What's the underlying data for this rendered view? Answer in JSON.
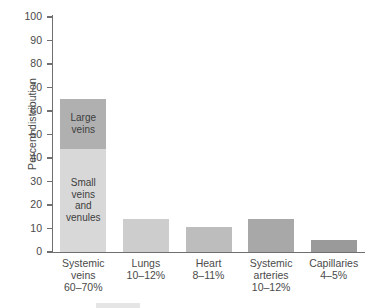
{
  "chart_data": {
    "type": "bar",
    "title": "",
    "xlabel": "",
    "ylabel": "Percent distribution",
    "ylim": [
      0,
      100
    ],
    "yticks": [
      0,
      10,
      20,
      30,
      40,
      50,
      60,
      70,
      80,
      90,
      100
    ],
    "grid": false,
    "legend": "none",
    "stacked": true,
    "categories": [
      "Systemic veins",
      "Lungs",
      "Heart",
      "Systemic arteries",
      "Capillaries"
    ],
    "category_ranges": [
      "60–70%",
      "10–12%",
      "8–11%",
      "10–12%",
      "4–5%"
    ],
    "bars": [
      {
        "category": "Systemic veins",
        "range_label": "60–70%",
        "total": 65,
        "segments": [
          {
            "label": "Small veins and venules",
            "label_lines": [
              "Small",
              "veins",
              "and",
              "venules"
            ],
            "value": 44,
            "base": 0,
            "color": "#d8d8d8"
          },
          {
            "label": "Large veins",
            "label_lines": [
              "Large",
              "veins"
            ],
            "value": 21,
            "base": 44,
            "color": "#b0b0b0"
          }
        ]
      },
      {
        "category": "Lungs",
        "range_label": "10–12%",
        "total": 14,
        "segments": [
          {
            "label": "",
            "label_lines": [],
            "value": 14,
            "base": 0,
            "color": "#cdcdcd"
          }
        ]
      },
      {
        "category": "Heart",
        "range_label": "8–11%",
        "total": 10.5,
        "segments": [
          {
            "label": "",
            "label_lines": [],
            "value": 10.5,
            "base": 0,
            "color": "#bdbdbd"
          }
        ]
      },
      {
        "category": "Systemic arteries",
        "range_label": "10–12%",
        "total": 14,
        "segments": [
          {
            "label": "",
            "label_lines": [],
            "value": 14,
            "base": 0,
            "color": "#a8a8a8"
          }
        ]
      },
      {
        "category": "Capillaries",
        "range_label": "4–5%",
        "total": 5,
        "segments": [
          {
            "label": "",
            "label_lines": [],
            "value": 5,
            "base": 0,
            "color": "#9a9a9a"
          }
        ]
      }
    ],
    "category_label_lines": [
      [
        "Systemic",
        "veins",
        "60–70%"
      ],
      [
        "Lungs",
        "10–12%"
      ],
      [
        "Heart",
        "8–11%"
      ],
      [
        "Systemic",
        "arteries",
        "10–12%"
      ],
      [
        "Capillaries",
        "4–5%"
      ]
    ],
    "colors": {
      "axis": "#6f6f6f",
      "text": "#4a4a4a",
      "bar_light": "#d8d8d8",
      "bar_mid": "#bdbdbd",
      "bar_dark": "#a8a8a8",
      "background": "#ffffff"
    }
  }
}
